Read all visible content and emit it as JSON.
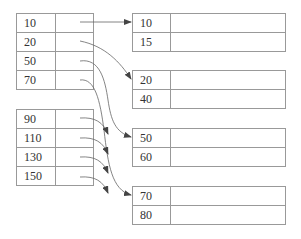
{
  "diagram": {
    "index_upper": {
      "keys": [
        "10",
        "20",
        "50",
        "70"
      ]
    },
    "index_lower": {
      "keys": [
        "90",
        "110",
        "130",
        "150"
      ]
    },
    "buckets": [
      {
        "keys": [
          "10",
          "15"
        ]
      },
      {
        "keys": [
          "20",
          "40"
        ]
      },
      {
        "keys": [
          "50",
          "60"
        ]
      },
      {
        "keys": [
          "70",
          "80"
        ]
      }
    ],
    "arrows": [
      {
        "from": "index_upper.10",
        "to": "bucket.1"
      },
      {
        "from": "index_upper.20",
        "to": "bucket.2"
      },
      {
        "from": "index_upper.50",
        "to": "bucket.3"
      },
      {
        "from": "index_upper.70",
        "to": "bucket.4"
      },
      {
        "from": "index_lower.90",
        "to": "dangling"
      },
      {
        "from": "index_lower.110",
        "to": "dangling"
      },
      {
        "from": "index_lower.130",
        "to": "dangling"
      },
      {
        "from": "index_lower.150",
        "to": "dangling"
      }
    ],
    "colors": {
      "line": "#999999",
      "arrow": "#444444",
      "text": "#333333"
    }
  }
}
